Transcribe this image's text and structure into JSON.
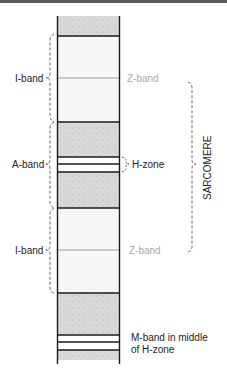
{
  "colors": {
    "outline": "#1a1a1a",
    "dark_band": "#d9d9d9",
    "light_band": "#f7f7f7",
    "z_line": "#a0a0a0",
    "label_gray": "#a8a8a8",
    "label_dark": "#222222",
    "bracket": "#555555"
  },
  "labels": {
    "i_band_top": "I-band",
    "z_band_top": "Z-band",
    "a_band": "A-band",
    "h_zone": "H-zone",
    "sarcomere": "SARCOMERE",
    "i_band_bottom": "I-band",
    "z_band_bottom": "Z-band",
    "m_band_line1": "M-band in middle",
    "m_band_line2": "of H-zone"
  }
}
